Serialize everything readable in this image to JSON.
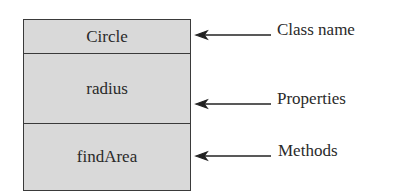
{
  "diagram": {
    "type": "UML class box",
    "class_box": {
      "class_name": "Circle",
      "properties": "radius",
      "methods": "findArea",
      "fill_color": "#d9d9d9",
      "border_color": "#3a3a3a"
    },
    "annotations": [
      {
        "label": "Class name",
        "points_to": "class_name"
      },
      {
        "label": "Properties",
        "points_to": "properties"
      },
      {
        "label": "Methods",
        "points_to": "methods"
      }
    ]
  }
}
